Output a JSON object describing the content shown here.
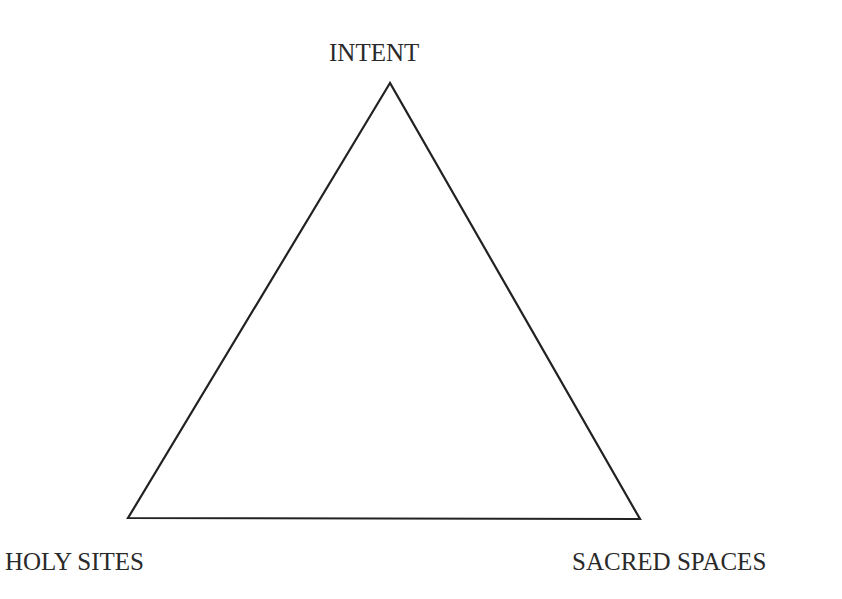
{
  "diagram": {
    "type": "triangle",
    "vertices": {
      "top": "INTENT",
      "bottom_left": "HOLY SITES",
      "bottom_right": "SACRED SPACES"
    },
    "line_color": "#222222",
    "background": "#ffffff"
  }
}
